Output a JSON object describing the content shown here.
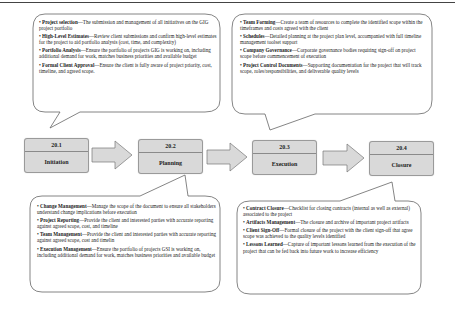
{
  "stages": [
    {
      "number": "20.1",
      "name": "Initiation"
    },
    {
      "number": "20.2",
      "name": "Planning"
    },
    {
      "number": "20.3",
      "name": "Execution"
    },
    {
      "number": "20.4",
      "name": "Closure"
    }
  ],
  "callouts": {
    "initiation": [
      {
        "term": "Project selection",
        "desc": "—The submission and management of all initiatives on the GIG project portfolio"
      },
      {
        "term": "High-Level Estimates",
        "desc": "—Review client submissions and confirm high-level estimates for the project to aid portfolio analysis (cost, time, and complexity)"
      },
      {
        "term": "Portfolio Analysis",
        "desc": "—Ensure the portfolio of projects GIG is working on, including additional demand for work, matches business priorities and available budget"
      },
      {
        "term": "Formal Client Approval",
        "desc": "—Ensure the client is fully aware of project priority, cost, timeline, and agreed scope."
      }
    ],
    "execution": [
      {
        "term": "Team Forming",
        "desc": "—Create a team of resources to complete the identified scope within the timeframes and costs agreed with the client"
      },
      {
        "term": "Schedules",
        "desc": "—Detailed planning at the project plan level, accompanied with full timeline management toolset support"
      },
      {
        "term": "Company Governance",
        "desc": "—Corporate governance bodies requiring sign-off on project scope before commencement of execution"
      },
      {
        "term": "Project Control Documents",
        "desc": "—Supporting documentation for the project that will track scope, roles/responsibilities, and deliverable quality levels"
      }
    ],
    "planning": [
      {
        "term": "Change Management",
        "desc": "—Manage the scope of the document to ensure all stakeholders understand change implications before execution"
      },
      {
        "term": "Project Reporting",
        "desc": "—Provide the client and interested parties with accurate reporting against agreed scope, cost, and timeline"
      },
      {
        "term": "Team Management",
        "desc": "—Provide the client and interested parties with accurate reporting against agreed scope, cost and timelin"
      },
      {
        "term": "Execution Management",
        "desc": "—Ensure the portfolio of projects GSI is working on, including additional demand for work, matches business priorities and available budget"
      }
    ],
    "closure": [
      {
        "term": "Contract Closure",
        "desc": "—Checklist for closing contracts (internal as well as external) associated to the project"
      },
      {
        "term": "Artifacts Management",
        "desc": "—The closure and archive of important project artifacts"
      },
      {
        "term": "Client Sign-Off",
        "desc": "—Formal closure of the project with the client sign-off that agree scope was achieved to the quality levels identified"
      },
      {
        "term": "Lessons Learned",
        "desc": "—Capture of important lessons learned from the execution of the project that can be fed back into future work to increase efficiency"
      }
    ]
  },
  "colors": {
    "stage_fill": "#d9d9d9",
    "arrow_fill": "#d9d9d9",
    "outline": "#777777"
  }
}
